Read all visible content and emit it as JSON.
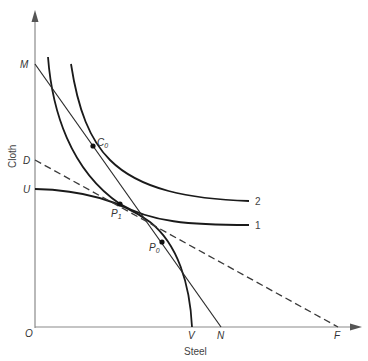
{
  "diagram": {
    "type": "production-possibility / indifference diagram",
    "axes": {
      "x_label": "Steel",
      "y_label": "Cloth",
      "origin_label": "O"
    },
    "y_axis_points": {
      "M": "M",
      "D": "D",
      "U": "U"
    },
    "x_axis_points": {
      "V": "V",
      "N": "N",
      "F": "F"
    },
    "points": {
      "C0": {
        "base": "C",
        "sub": "0"
      },
      "P1": {
        "base": "P",
        "sub": "1"
      },
      "P0": {
        "base": "P",
        "sub": "0"
      }
    },
    "curve_labels": {
      "indifference_2": "2",
      "indifference_1": "1"
    },
    "lines": [
      {
        "name": "MN",
        "style": "solid",
        "from": "M",
        "to": "N"
      },
      {
        "name": "DF",
        "style": "dashed",
        "from": "D",
        "to": "F"
      }
    ],
    "curves": [
      {
        "name": "production-frontier-UV",
        "from": "U",
        "to": "V"
      },
      {
        "name": "indifference-curve-1",
        "label": "1"
      },
      {
        "name": "indifference-curve-2",
        "label": "2"
      }
    ]
  }
}
